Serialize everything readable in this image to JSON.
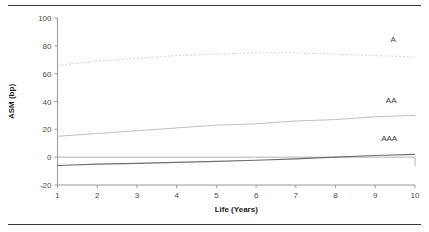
{
  "chart_data": {
    "type": "line",
    "title": "",
    "xlabel": "Life (Years)",
    "ylabel": "ASM (bp)",
    "xlim": [
      1,
      10
    ],
    "ylim": [
      -20,
      100
    ],
    "xticks": [
      1,
      2,
      3,
      4,
      5,
      6,
      7,
      8,
      9,
      10
    ],
    "yticks": [
      -20,
      0,
      20,
      40,
      60,
      80,
      100
    ],
    "xtick_labels": [
      "1",
      "2",
      "3",
      "4",
      "5",
      "6",
      "7",
      "8",
      "9",
      "10"
    ],
    "ytick_labels": [
      "-20",
      "0",
      "20",
      "40",
      "60",
      "80",
      "100"
    ],
    "grid": false,
    "legend_position": "inline-right-annotations",
    "x": [
      1,
      2,
      3,
      4,
      5,
      6,
      7,
      8,
      9,
      10
    ],
    "series": [
      {
        "name": "A",
        "style": "dotted",
        "color": "#d9d9d9",
        "values": [
          66,
          69,
          71,
          73,
          74,
          75,
          75,
          74,
          73,
          72
        ],
        "label": "A",
        "label_x": 9.45,
        "label_y": 85
      },
      {
        "name": "AA",
        "style": "solid-thin",
        "color": "#c2c2c2",
        "values": [
          15,
          17,
          19,
          21,
          23,
          24,
          26,
          27,
          29,
          30
        ],
        "label": "AA",
        "label_x": 9.4,
        "label_y": 41
      },
      {
        "name": "AAA",
        "style": "solid-thick",
        "color": "#6e6e6e",
        "values": [
          -6,
          -5,
          -4.4,
          -3.7,
          -3,
          -2.2,
          -1.2,
          0,
          1.2,
          2
        ],
        "label": "AAA",
        "label_x": 9.35,
        "label_y": 14
      }
    ],
    "annotations": [
      {
        "text": "A",
        "x": 9.45,
        "y": 85
      },
      {
        "text": "AA",
        "x": 9.4,
        "y": 41
      },
      {
        "text": "AAA",
        "x": 9.35,
        "y": 14
      }
    ]
  },
  "figure": {
    "top_rule": "",
    "bottom_rule": ""
  }
}
